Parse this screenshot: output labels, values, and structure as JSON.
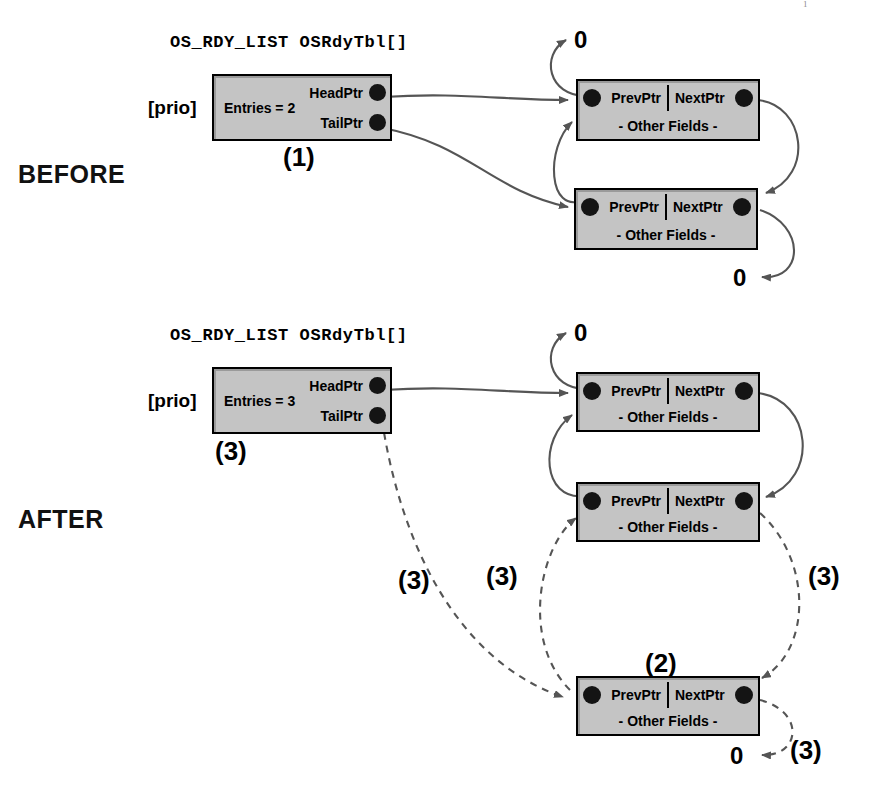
{
  "figure": {
    "top_artifact": "1",
    "struct_title": "OS_RDY_LIST OSRdyTbl[]",
    "prio_label": "[prio]",
    "node_prev_label": "PrevPtr",
    "node_next_label": "NextPtr",
    "node_other_label": "- Other Fields -",
    "head_ptr_label": "HeadPtr",
    "tail_ptr_label": "TailPtr",
    "null_label": "0",
    "colors": {
      "box_fill": "#c4c4c4",
      "box_border": "#000000",
      "dot": "#141414",
      "wire": "#555555",
      "text": "#000000"
    }
  },
  "before": {
    "phase_label": "BEFORE",
    "struct_title": "OS_RDY_LIST OSRdyTbl[]",
    "prio_label": "[prio]",
    "entries_label": "Entries = 2",
    "head_ptr_label": "HeadPtr",
    "tail_ptr_label": "TailPtr",
    "step_label": "(1)",
    "null_top": "0",
    "null_bottom": "0",
    "nodes": [
      {
        "prev": "PrevPtr",
        "next": "NextPtr",
        "other": "- Other Fields -"
      },
      {
        "prev": "PrevPtr",
        "next": "NextPtr",
        "other": "- Other Fields -"
      }
    ]
  },
  "after": {
    "phase_label": "AFTER",
    "struct_title": "OS_RDY_LIST OSRdyTbl[]",
    "prio_label": "[prio]",
    "entries_label": "Entries = 3",
    "head_ptr_label": "HeadPtr",
    "tail_ptr_label": "TailPtr",
    "step_label": "(3)",
    "null_top": "0",
    "null_bottom": "0",
    "step_tail_link": "(3)",
    "step_prev_link": "(3)",
    "step_next_link": "(3)",
    "step_null_link": "(3)",
    "step_new_node": "(2)",
    "nodes": [
      {
        "prev": "PrevPtr",
        "next": "NextPtr",
        "other": "- Other Fields -"
      },
      {
        "prev": "PrevPtr",
        "next": "NextPtr",
        "other": "- Other Fields -"
      },
      {
        "prev": "PrevPtr",
        "next": "NextPtr",
        "other": "- Other Fields -"
      }
    ]
  }
}
